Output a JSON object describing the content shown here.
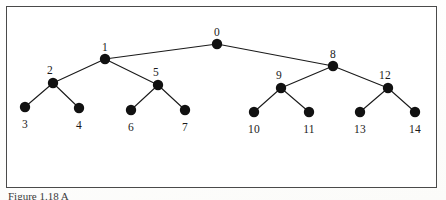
{
  "figure": {
    "caption": "Figure 1.18  A",
    "frame_color": "#4a4a4a",
    "background_color": "#ffffff",
    "node_color": "#111111",
    "edge_color": "#1a1a1a"
  },
  "graph": {
    "type": "tree",
    "node_radius": 5.2,
    "nodes": [
      {
        "id": "n0",
        "label": "0",
        "x": 217,
        "y": 44,
        "label_x": 217,
        "label_y": 26,
        "level": 0
      },
      {
        "id": "n1",
        "label": "1",
        "x": 105,
        "y": 59,
        "label_x": 105,
        "label_y": 41,
        "level": 1
      },
      {
        "id": "n8",
        "label": "8",
        "x": 333,
        "y": 66,
        "label_x": 333,
        "label_y": 48,
        "level": 1
      },
      {
        "id": "n2",
        "label": "2",
        "x": 53,
        "y": 83,
        "label_x": 50,
        "label_y": 64,
        "level": 2
      },
      {
        "id": "n5",
        "label": "5",
        "x": 158,
        "y": 85,
        "label_x": 156,
        "label_y": 66,
        "level": 2
      },
      {
        "id": "n9",
        "label": "9",
        "x": 281,
        "y": 88,
        "label_x": 279,
        "label_y": 69,
        "level": 2
      },
      {
        "id": "n12",
        "label": "12",
        "x": 388,
        "y": 88,
        "label_x": 385,
        "label_y": 69,
        "level": 2
      },
      {
        "id": "n3",
        "label": "3",
        "x": 25,
        "y": 107,
        "label_x": 25,
        "label_y": 118,
        "level": 3
      },
      {
        "id": "n4",
        "label": "4",
        "x": 79,
        "y": 108,
        "label_x": 79,
        "label_y": 119,
        "level": 3
      },
      {
        "id": "n6",
        "label": "6",
        "x": 131,
        "y": 110,
        "label_x": 131,
        "label_y": 121,
        "level": 3
      },
      {
        "id": "n7",
        "label": "7",
        "x": 185,
        "y": 110,
        "label_x": 185,
        "label_y": 121,
        "level": 3
      },
      {
        "id": "n10",
        "label": "10",
        "x": 254,
        "y": 112,
        "label_x": 254,
        "label_y": 123,
        "level": 3
      },
      {
        "id": "n11",
        "label": "11",
        "x": 309,
        "y": 112,
        "label_x": 309,
        "label_y": 123,
        "level": 3
      },
      {
        "id": "n13",
        "label": "13",
        "x": 360,
        "y": 112,
        "label_x": 360,
        "label_y": 123,
        "level": 3
      },
      {
        "id": "n14",
        "label": "14",
        "x": 415,
        "y": 112,
        "label_x": 415,
        "label_y": 123,
        "level": 3
      }
    ],
    "edges": [
      {
        "from": "n0",
        "to": "n1"
      },
      {
        "from": "n0",
        "to": "n8"
      },
      {
        "from": "n1",
        "to": "n2"
      },
      {
        "from": "n1",
        "to": "n5"
      },
      {
        "from": "n8",
        "to": "n9"
      },
      {
        "from": "n8",
        "to": "n12"
      },
      {
        "from": "n2",
        "to": "n3"
      },
      {
        "from": "n2",
        "to": "n4"
      },
      {
        "from": "n5",
        "to": "n6"
      },
      {
        "from": "n5",
        "to": "n7"
      },
      {
        "from": "n9",
        "to": "n10"
      },
      {
        "from": "n9",
        "to": "n11"
      },
      {
        "from": "n12",
        "to": "n13"
      },
      {
        "from": "n12",
        "to": "n14"
      }
    ]
  }
}
